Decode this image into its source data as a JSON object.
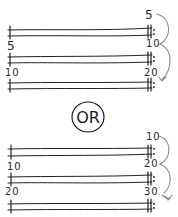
{
  "diagram": {
    "title": "",
    "colors": {
      "ink": "#222222",
      "arrow": "#8a8a8a",
      "background": "#ffffff"
    },
    "top_group": {
      "right_labels": [
        "5",
        "10",
        "20"
      ],
      "left_labels": [
        "5",
        "10"
      ],
      "staff_count": 3
    },
    "separator": {
      "label": "OR"
    },
    "bottom_group": {
      "right_labels": [
        "10",
        "20",
        "30"
      ],
      "left_labels": [
        "10",
        "20"
      ],
      "staff_count": 3
    }
  }
}
